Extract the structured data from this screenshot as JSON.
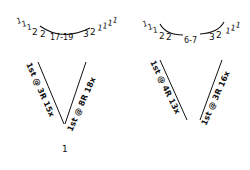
{
  "diagrams": [
    {
      "id": "left",
      "top_row": {
        "ticks_left": [
          "1",
          "1",
          "1"
        ],
        "numbers_left": [
          "2",
          "2"
        ],
        "center": "17-19",
        "numbers_right": [
          "3",
          "2"
        ],
        "ticks_right": [
          "1",
          "1",
          "1",
          "1"
        ]
      },
      "left_leg_label": "1st @ 3R 15x",
      "right_leg_label": "1st @ 8R 18x",
      "bottom_mark": "1"
    },
    {
      "id": "right",
      "top_row": {
        "ticks_left": [
          "1",
          "1",
          "1"
        ],
        "numbers_left": [
          "2",
          "2"
        ],
        "center": "6-7",
        "numbers_right": [
          "3",
          "2"
        ],
        "ticks_right": [
          "1",
          "1",
          "1"
        ]
      },
      "left_leg_label": "1st @ 4R 13x",
      "right_leg_label": "1st @ 3R 16x"
    }
  ],
  "colors": {
    "ink": "#111111",
    "paper": "#ffffff"
  }
}
